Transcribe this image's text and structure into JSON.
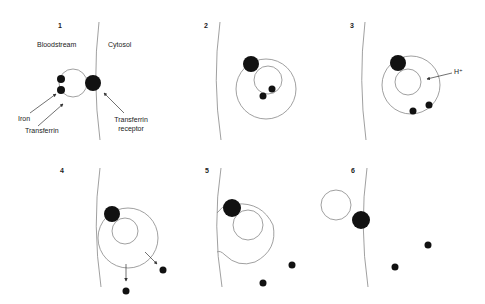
{
  "figure": {
    "type": "transferrin cycle diagram",
    "panels": [
      {
        "number": "1",
        "labels": {
          "left_region": "Bloodstream",
          "right_region": "Cytosol",
          "iron": "Iron",
          "transferrin": "Transferrin",
          "receptor_line1": "Transferrin",
          "receptor_line2": "receptor"
        }
      },
      {
        "number": "2"
      },
      {
        "number": "3",
        "labels": {
          "proton": "H⁺"
        }
      },
      {
        "number": "4"
      },
      {
        "number": "5"
      },
      {
        "number": "6"
      }
    ],
    "colors": {
      "ink": "#111111",
      "line": "#888888",
      "background": "#ffffff"
    }
  }
}
